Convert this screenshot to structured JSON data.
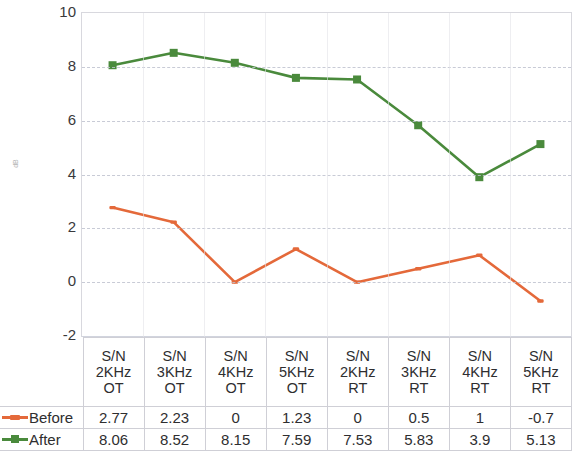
{
  "chart_data": {
    "type": "line",
    "title": "",
    "xlabel": "",
    "ylabel": "dB",
    "ylim": [
      -2,
      10
    ],
    "ytick_step": 2,
    "yticks": [
      10,
      8,
      6,
      4,
      2,
      0,
      -2
    ],
    "grid": true,
    "legend_position": "table-left",
    "categories": [
      "S/N 2KHz OT",
      "S/N 3KHz OT",
      "S/N 4KHz OT",
      "S/N 5KHz OT",
      "S/N 2KHz RT",
      "S/N 3KHz RT",
      "S/N 4KHz RT",
      "S/N 5KHz RT"
    ],
    "category_lines": [
      [
        "S/N",
        "2KHz",
        "OT"
      ],
      [
        "S/N",
        "3KHz",
        "OT"
      ],
      [
        "S/N",
        "4KHz",
        "OT"
      ],
      [
        "S/N",
        "5KHz",
        "OT"
      ],
      [
        "S/N",
        "2KHz",
        "RT"
      ],
      [
        "S/N",
        "3KHz",
        "RT"
      ],
      [
        "S/N",
        "4KHz",
        "RT"
      ],
      [
        "S/N",
        "5KHz",
        "RT"
      ]
    ],
    "series": [
      {
        "name": "Before",
        "color": "#e4693a",
        "marker": "dash",
        "values": [
          2.77,
          2.23,
          0,
          1.23,
          0,
          0.5,
          1,
          -0.7
        ],
        "value_labels": [
          "2.77",
          "2.23",
          "0",
          "1.23",
          "0",
          "0.5",
          "1",
          "-0.7"
        ]
      },
      {
        "name": "After",
        "color": "#4a8a3c",
        "marker": "square",
        "values": [
          8.06,
          8.52,
          8.15,
          7.59,
          7.53,
          5.83,
          3.9,
          5.13
        ],
        "value_labels": [
          "8.06",
          "8.52",
          "8.15",
          "7.59",
          "7.53",
          "5.83",
          "3.9",
          "5.13"
        ]
      }
    ]
  },
  "axis": {
    "y_title": "dB",
    "tick_labels": [
      "10",
      "8",
      "6",
      "4",
      "2",
      "0",
      "-2"
    ]
  },
  "legend": {
    "before_label": "Before",
    "after_label": "After"
  }
}
